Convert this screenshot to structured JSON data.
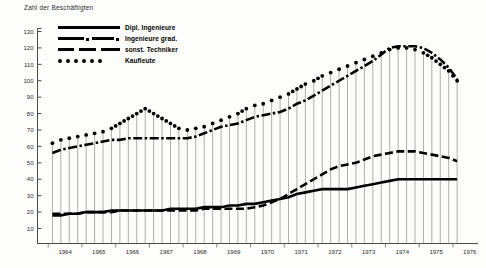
{
  "chart_data": {
    "type": "line",
    "title": "Zahl der Beschäftigten",
    "xlabel": "",
    "ylabel": "Zahl der Beschäftigten",
    "ylim": [
      0,
      130
    ],
    "yticks": [
      130,
      120,
      110,
      100,
      90,
      80,
      70,
      60,
      50,
      40,
      30,
      20,
      10
    ],
    "xlim": [
      1963.75,
      1976.5
    ],
    "xtick_labels": [
      "1964",
      "1965",
      "1966",
      "1967",
      "1968",
      "1969",
      "1970",
      "1971",
      "1972",
      "1973",
      "1974",
      "1975",
      "1976"
    ],
    "grid": false,
    "minor_ticks": "quarterly",
    "legend_position": "upper-left-inside",
    "x": [
      1964.0,
      1964.25,
      1964.5,
      1964.75,
      1965.0,
      1965.25,
      1965.5,
      1965.75,
      1966.0,
      1966.25,
      1966.5,
      1966.75,
      1967.0,
      1967.25,
      1967.5,
      1967.75,
      1968.0,
      1968.25,
      1968.5,
      1968.75,
      1969.0,
      1969.25,
      1969.5,
      1969.75,
      1970.0,
      1970.25,
      1970.5,
      1970.75,
      1971.0,
      1971.25,
      1971.5,
      1971.75,
      1972.0,
      1972.25,
      1972.5,
      1972.75,
      1973.0,
      1973.25,
      1973.5,
      1973.75,
      1974.0,
      1974.25,
      1974.5,
      1974.75,
      1975.0,
      1975.25,
      1975.5,
      1975.75,
      1976.0
    ],
    "series": [
      {
        "name": "Dipl. Ingenieure",
        "style": "solid",
        "values": [
          18,
          18,
          19,
          19,
          20,
          20,
          20,
          21,
          21,
          21,
          21,
          21,
          21,
          21,
          22,
          22,
          22,
          22,
          23,
          23,
          23,
          24,
          24,
          25,
          25,
          26,
          27,
          28,
          29,
          31,
          32,
          33,
          34,
          34,
          34,
          34,
          35,
          36,
          37,
          38,
          39,
          40,
          40,
          40,
          40,
          40,
          40,
          40,
          40
        ]
      },
      {
        "name": "Ingenieure grad.",
        "style": "dash-dot",
        "values": [
          56,
          58,
          59,
          60,
          61,
          62,
          63,
          64,
          64,
          65,
          65,
          65,
          65,
          65,
          65,
          65,
          65,
          66,
          68,
          70,
          72,
          73,
          74,
          76,
          78,
          79,
          80,
          81,
          83,
          86,
          88,
          91,
          94,
          97,
          100,
          103,
          106,
          109,
          112,
          116,
          120,
          121,
          121,
          121,
          120,
          117,
          113,
          108,
          101
        ]
      },
      {
        "name": "sonst. Techniker",
        "style": "dashed",
        "values": [
          19,
          19,
          19,
          19,
          20,
          20,
          20,
          20,
          21,
          21,
          21,
          21,
          21,
          21,
          21,
          21,
          21,
          21,
          22,
          22,
          22,
          22,
          22,
          22,
          23,
          24,
          26,
          28,
          31,
          34,
          37,
          40,
          43,
          46,
          48,
          49,
          50,
          52,
          54,
          55,
          56,
          57,
          57,
          57,
          56,
          55,
          54,
          53,
          51
        ]
      },
      {
        "name": "Kaufleute",
        "style": "dotted",
        "values": [
          62,
          64,
          65,
          66,
          67,
          68,
          69,
          71,
          74,
          77,
          80,
          83,
          80,
          77,
          74,
          71,
          70,
          71,
          72,
          74,
          76,
          78,
          80,
          83,
          85,
          86,
          88,
          90,
          92,
          95,
          98,
          100,
          103,
          105,
          107,
          109,
          111,
          113,
          115,
          117,
          119,
          120,
          120,
          119,
          117,
          114,
          110,
          106,
          100
        ]
      }
    ]
  },
  "legend": {
    "items": [
      {
        "label": "Dipl. Ingenieure",
        "key": "solid"
      },
      {
        "label": "Ingenieure grad.",
        "key": "dash-dot"
      },
      {
        "label": "sonst. Techniker",
        "key": "dashed"
      },
      {
        "label": "Kaufleute",
        "key": "dotted"
      }
    ]
  }
}
